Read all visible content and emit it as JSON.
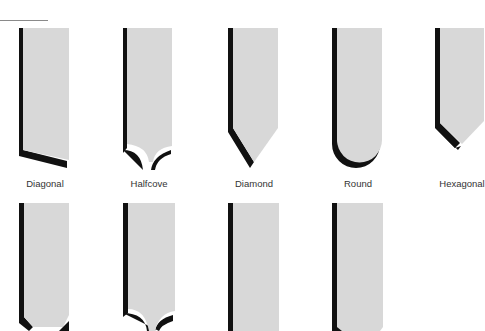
{
  "figure": {
    "colors": {
      "face": "#d8d8d8",
      "shadow": "#111111",
      "rule": "#8a8a8a",
      "label": "#333333"
    },
    "rows": [
      {
        "tools": [
          {
            "name": "Diagonal",
            "profile": "diagonal"
          },
          {
            "name": "Halfcove",
            "profile": "halfcove"
          },
          {
            "name": "Diamond",
            "profile": "diamond"
          },
          {
            "name": "Round",
            "profile": "round"
          },
          {
            "name": "Hexagonal",
            "profile": "hexagonal"
          }
        ]
      },
      {
        "tools": [
          {
            "name": "",
            "profile": "hexagonal-partial"
          },
          {
            "name": "",
            "profile": "halfcove-partial"
          },
          {
            "name": "",
            "profile": "square-partial"
          },
          {
            "name": "",
            "profile": "square-chamfer-partial"
          }
        ]
      }
    ]
  }
}
